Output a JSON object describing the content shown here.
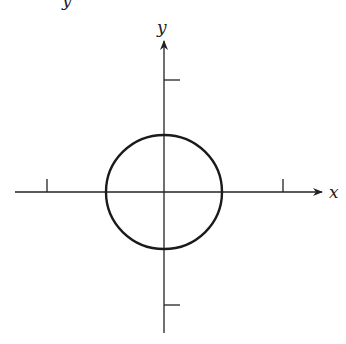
{
  "diagram": {
    "type": "coordinate-plane",
    "axes": {
      "x_label": "x",
      "y_label": "y",
      "origin_px": [
        164,
        192
      ],
      "x_ticks_px": [
        47,
        283
      ],
      "y_ticks_px": [
        80,
        305
      ]
    },
    "shapes": [
      {
        "type": "circle",
        "center": [
          0,
          0
        ],
        "radius_px": 58,
        "stroke": "#1a1a1a"
      }
    ],
    "top_partial_glyph": "y"
  },
  "colors": {
    "axis": "#222222",
    "curve": "#1a1a1a",
    "background": "#ffffff"
  }
}
